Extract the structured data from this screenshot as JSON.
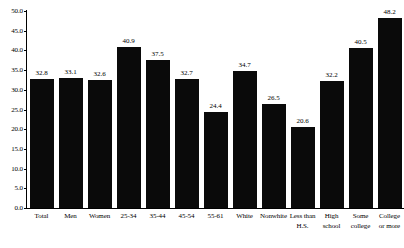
{
  "chart_data": {
    "type": "bar",
    "title": "",
    "subtitle": "",
    "xlabel": "",
    "ylabel": "",
    "ylim": [
      0.0,
      50.0
    ],
    "ytick_step": 5.0,
    "yticks": [
      "0.0",
      "5.0",
      "10.0",
      "15.0",
      "20.0",
      "25.0",
      "30.0",
      "35.0",
      "40.0",
      "45.0",
      "50.0"
    ],
    "grid": false,
    "legend": "none",
    "bar_color": "#0a0a0a",
    "background_color": "#ffffff",
    "axis_color": "#000000",
    "data_labels_shown": true,
    "categories": [
      "Total",
      "Men",
      "Women",
      "25-34",
      "35-44",
      "45-54",
      "55-61",
      "White",
      "Nonwhite",
      "Less than\nH.S.",
      "High\nschool",
      "Some\ncollege",
      "College\nor more"
    ],
    "values": [
      32.8,
      33.1,
      32.6,
      40.9,
      37.5,
      32.7,
      24.4,
      34.7,
      26.5,
      20.6,
      32.2,
      40.5,
      48.2
    ],
    "value_labels": [
      "32.8",
      "33.1",
      "32.6",
      "40.9",
      "37.5",
      "32.7",
      "24.4",
      "34.7",
      "26.5",
      "20.6",
      "32.2",
      "40.5",
      "48.2"
    ]
  }
}
